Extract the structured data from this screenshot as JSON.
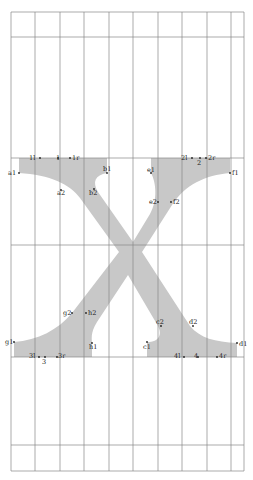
{
  "diagram": {
    "glyph": "X",
    "colors": {
      "glyph_fill": "#c8c8c8",
      "grid": "#888888",
      "label": "#222222"
    },
    "grid": {
      "vertical_x": [
        11,
        35,
        60,
        84,
        109,
        133,
        158,
        182,
        207,
        231,
        244
      ],
      "horizontal_y": [
        12,
        37,
        158,
        245,
        357,
        445,
        471
      ]
    },
    "points": [
      {
        "id": "a1",
        "x": 19,
        "y": 173,
        "lx": 8,
        "ly": 175
      },
      {
        "id": "1l",
        "x": 40,
        "y": 158,
        "lx": 29,
        "ly": 160
      },
      {
        "id": "1",
        "x": 58,
        "y": 158,
        "lx": 56,
        "ly": 160
      },
      {
        "id": "1r",
        "x": 70,
        "y": 158,
        "lx": 72,
        "ly": 160
      },
      {
        "id": "a2",
        "x": 61,
        "y": 190,
        "lx": 57,
        "ly": 195
      },
      {
        "id": "b1",
        "x": 107,
        "y": 173,
        "lx": 103,
        "ly": 171
      },
      {
        "id": "b2",
        "x": 94,
        "y": 189,
        "lx": 89,
        "ly": 195
      },
      {
        "id": "e1",
        "x": 151,
        "y": 173,
        "lx": 147,
        "ly": 172
      },
      {
        "id": "2l",
        "x": 192,
        "y": 158,
        "lx": 181,
        "ly": 160
      },
      {
        "id": "2",
        "x": 200,
        "y": 158,
        "lx": 197,
        "ly": 165
      },
      {
        "id": "2r",
        "x": 206,
        "y": 158,
        "lx": 208,
        "ly": 160
      },
      {
        "id": "f1",
        "x": 230,
        "y": 173,
        "lx": 232,
        "ly": 175
      },
      {
        "id": "e2",
        "x": 158,
        "y": 202,
        "lx": 149,
        "ly": 204
      },
      {
        "id": "f2",
        "x": 171,
        "y": 202,
        "lx": 173,
        "ly": 204
      },
      {
        "id": "g2",
        "x": 72,
        "y": 313,
        "lx": 63,
        "ly": 315
      },
      {
        "id": "h2",
        "x": 86,
        "y": 313,
        "lx": 88,
        "ly": 315
      },
      {
        "id": "g1",
        "x": 14,
        "y": 342,
        "lx": 5,
        "ly": 344
      },
      {
        "id": "h1",
        "x": 92,
        "y": 343,
        "lx": 89,
        "ly": 349
      },
      {
        "id": "3l",
        "x": 39,
        "y": 357,
        "lx": 29,
        "ly": 358
      },
      {
        "id": "3",
        "x": 45,
        "y": 357,
        "lx": 42,
        "ly": 364
      },
      {
        "id": "3r",
        "x": 57,
        "y": 357,
        "lx": 58,
        "ly": 358
      },
      {
        "id": "c2",
        "x": 161,
        "y": 326,
        "lx": 156,
        "ly": 324
      },
      {
        "id": "d2",
        "x": 193,
        "y": 326,
        "lx": 189,
        "ly": 324
      },
      {
        "id": "c1",
        "x": 147,
        "y": 342,
        "lx": 143,
        "ly": 349
      },
      {
        "id": "d1",
        "x": 237,
        "y": 343,
        "lx": 239,
        "ly": 346
      },
      {
        "id": "4l",
        "x": 184,
        "y": 357,
        "lx": 174,
        "ly": 358
      },
      {
        "id": "4",
        "x": 198,
        "y": 357,
        "lx": 194,
        "ly": 358
      },
      {
        "id": "4r",
        "x": 217,
        "y": 357,
        "lx": 219,
        "ly": 358
      }
    ]
  }
}
